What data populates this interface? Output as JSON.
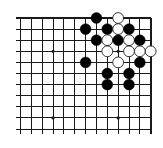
{
  "board": {
    "board_size": 19,
    "view": "top-right corner",
    "visible_columns": 13,
    "visible_rows": 11,
    "colors": {
      "background": "#ffffff",
      "line": "#1a1a1a",
      "black_stone": "#000000",
      "white_stone": "#ffffff",
      "white_stone_outline": "#222222"
    },
    "grid": {
      "x0": 20.5,
      "y0": 18,
      "dx": 10.85,
      "dy": 11.1,
      "line_extend_left": 5,
      "line_extend_bottom": 5
    },
    "edges": {
      "top": true,
      "right": true,
      "left": false,
      "bottom": false
    },
    "star_points": [
      {
        "col": 3,
        "row": 3
      },
      {
        "col": 9,
        "row": 3
      },
      {
        "col": 3,
        "row": 9
      },
      {
        "col": 9,
        "row": 9
      }
    ],
    "stones": [
      {
        "color": "black",
        "col": 7,
        "row": 0
      },
      {
        "color": "white",
        "col": 9,
        "row": 0
      },
      {
        "color": "black",
        "col": 6,
        "row": 1
      },
      {
        "color": "black",
        "col": 8,
        "row": 1
      },
      {
        "color": "white",
        "col": 9,
        "row": 1
      },
      {
        "color": "black",
        "col": 10,
        "row": 1
      },
      {
        "color": "black",
        "col": 7,
        "row": 2
      },
      {
        "color": "white",
        "col": 8,
        "row": 2
      },
      {
        "color": "black",
        "col": 9,
        "row": 2
      },
      {
        "color": "white",
        "col": 10,
        "row": 2
      },
      {
        "color": "black",
        "col": 11,
        "row": 2
      },
      {
        "color": "white",
        "col": 8,
        "row": 3
      },
      {
        "color": "white",
        "col": 10,
        "row": 3
      },
      {
        "color": "white",
        "col": 11,
        "row": 3
      },
      {
        "color": "white",
        "col": 12,
        "row": 3
      },
      {
        "color": "black",
        "col": 6,
        "row": 4
      },
      {
        "color": "white",
        "col": 9,
        "row": 4
      },
      {
        "color": "black",
        "col": 11,
        "row": 4
      },
      {
        "color": "black",
        "col": 8,
        "row": 5
      },
      {
        "color": "black",
        "col": 10,
        "row": 5
      },
      {
        "color": "black",
        "col": 8,
        "row": 6
      },
      {
        "color": "black",
        "col": 10,
        "row": 6
      }
    ],
    "stone_radius": 5.4
  }
}
